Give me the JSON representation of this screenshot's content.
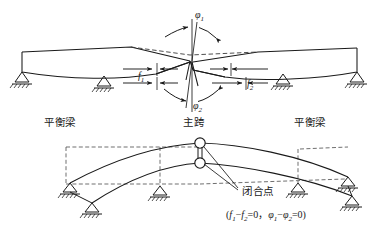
{
  "figure": {
    "colors": {
      "line": "#1a1a1a",
      "dashed": "#555555",
      "background": "#ffffff"
    }
  },
  "upper_diagram": {
    "name": "deformed-state-before-closure",
    "labels": {
      "phi1": "φ",
      "phi1_sub": "1",
      "phi2": "φ",
      "phi2_sub": "2",
      "f1": "f",
      "f1_sub": "1",
      "f2": "f",
      "f2_sub": "2"
    },
    "supports": [
      {
        "name": "support-left-end",
        "x": 28,
        "y": 78
      },
      {
        "name": "support-left-inner",
        "x": 104,
        "y": 81
      },
      {
        "name": "support-right-inner",
        "x": 283,
        "y": 79
      },
      {
        "name": "support-right-end",
        "x": 355,
        "y": 76
      }
    ]
  },
  "section_labels": {
    "left_balance_beam": "平衡梁",
    "main_span": "主跨",
    "right_balance_beam": "平衡梁"
  },
  "lower_diagram": {
    "name": "closed-state-after-closure",
    "closure_point_label": "闭合点",
    "formula": {
      "open": "(",
      "f1": "f",
      "f1_sub": "1",
      "minus1": "−",
      "f2": "f",
      "f2_sub": "2",
      "eq1": "=0，",
      "phi1": "φ",
      "phi1_sub": "1",
      "minus2": "−",
      "phi2": "φ",
      "phi2_sub": "2",
      "eq2": "=0",
      "close": ")"
    },
    "supports": [
      {
        "name": "support-ll-upper",
        "x": 68,
        "y": 185
      },
      {
        "name": "support-ll-lower",
        "x": 92,
        "y": 205
      },
      {
        "name": "support-l-inner",
        "x": 160,
        "y": 186
      },
      {
        "name": "support-r-inner",
        "x": 298,
        "y": 183
      },
      {
        "name": "support-rr-upper",
        "x": 345,
        "y": 178
      },
      {
        "name": "support-rr-lower",
        "x": 352,
        "y": 198
      }
    ]
  }
}
